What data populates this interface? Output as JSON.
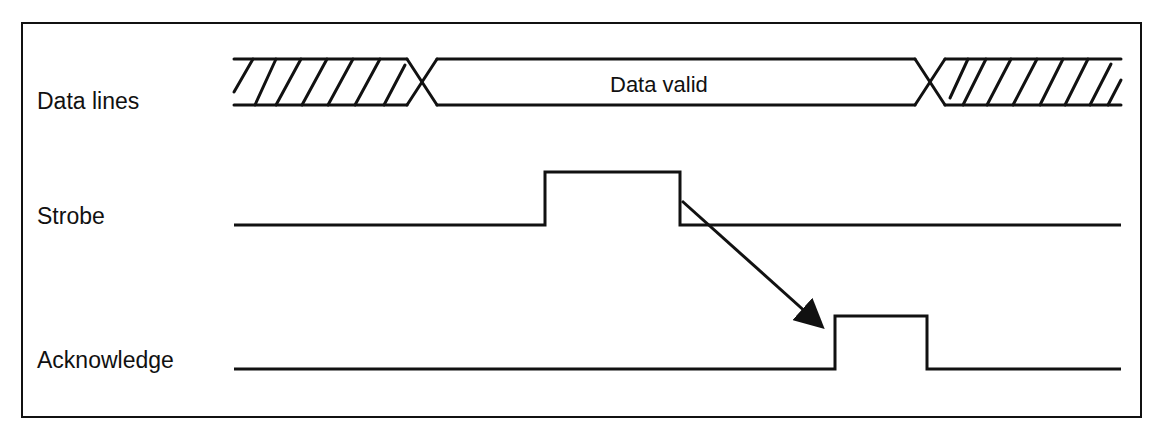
{
  "diagram": {
    "type": "timing-diagram",
    "signals": [
      {
        "name": "Data lines",
        "kind": "bus",
        "states": [
          "invalid",
          "valid",
          "invalid"
        ],
        "valid_label": "Data valid"
      },
      {
        "name": "Strobe",
        "kind": "digital",
        "pulse": "high pulse while data valid"
      },
      {
        "name": "Acknowledge",
        "kind": "digital",
        "pulse": "high pulse after strobe falling edge"
      }
    ],
    "arrow": {
      "from": "Strobe falling edge",
      "to": "Acknowledge rising edge"
    },
    "colors": {
      "ink": "#111111",
      "background": "#ffffff"
    }
  },
  "labels": {
    "data_lines": "Data lines",
    "data_valid": "Data valid",
    "strobe": "Strobe",
    "acknowledge": "Acknowledge"
  }
}
